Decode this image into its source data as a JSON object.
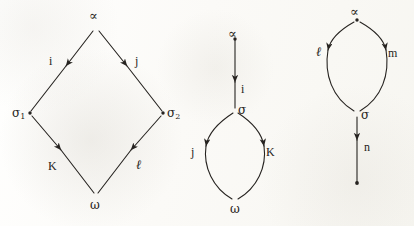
{
  "figure": {
    "background_color": "#fdfdfb",
    "ink_color": "#262320",
    "stroke_width": 1.1,
    "caption_smudge": "",
    "diagrams": [
      {
        "id": "diamond-diagram",
        "name": "diamond",
        "shape": "diamond",
        "nodes": [
          {
            "id": "alpha",
            "label": "∝",
            "role": "top",
            "x": 96,
            "y": 28,
            "label_x": 89,
            "label_y": 9,
            "dot": false
          },
          {
            "id": "sigma1",
            "label": "σ",
            "subscript": "1",
            "role": "left",
            "x": 30,
            "y": 113,
            "label_x": 12,
            "label_y": 107,
            "dot": true
          },
          {
            "id": "sigma2",
            "label": "σ",
            "subscript": "2",
            "role": "right",
            "x": 163,
            "y": 113,
            "label_x": 167,
            "label_y": 107,
            "dot": true
          },
          {
            "id": "omega",
            "label": "ω",
            "role": "bottom",
            "x": 96,
            "y": 197,
            "label_x": 90,
            "label_y": 199,
            "dot": false
          }
        ],
        "edges": [
          {
            "id": "alpha-sigma1",
            "label": "i",
            "from": "alpha",
            "to": "sigma1",
            "label_x": 49,
            "label_y": 55
          },
          {
            "id": "alpha-sigma2",
            "label": "j",
            "from": "alpha",
            "to": "sigma2",
            "label_x": 135,
            "label_y": 55
          },
          {
            "id": "sigma1-omega",
            "label": "K",
            "from": "sigma1",
            "to": "omega",
            "label_x": 48,
            "label_y": 160
          },
          {
            "id": "sigma2-omega",
            "label": "ℓ",
            "from": "sigma2",
            "to": "omega",
            "label_x": 136,
            "label_y": 158
          }
        ]
      },
      {
        "id": "lens-below-diagram",
        "name": "arrow-then-lens",
        "shape": "arrow-over-lens",
        "nodes": [
          {
            "id": "alpha",
            "label": "∝",
            "role": "top",
            "x": 235,
            "y": 38,
            "label_x": 228,
            "label_y": 27,
            "dot": true
          },
          {
            "id": "sigma",
            "label": "σ",
            "role": "middle",
            "x": 235,
            "y": 110,
            "label_x": 238,
            "label_y": 104,
            "dot": false
          },
          {
            "id": "omega",
            "label": "ω",
            "role": "bottom",
            "x": 235,
            "y": 202,
            "label_x": 230,
            "label_y": 203,
            "dot": false
          }
        ],
        "edges": [
          {
            "id": "alpha-sigma",
            "label": "i",
            "from": "alpha",
            "to": "sigma",
            "label_x": 241,
            "label_y": 83
          },
          {
            "id": "sigma-omega-left",
            "label": "j",
            "from": "sigma",
            "to": "omega",
            "side": "left",
            "label_x": 191,
            "label_y": 146
          },
          {
            "id": "sigma-omega-right",
            "label": "K",
            "from": "sigma",
            "to": "omega",
            "side": "right",
            "label_x": 266,
            "label_y": 146
          }
        ]
      },
      {
        "id": "lens-above-diagram",
        "name": "lens-then-arrow",
        "shape": "lens-over-arrow",
        "nodes": [
          {
            "id": "alpha",
            "label": "∝",
            "role": "top",
            "x": 357,
            "y": 20,
            "label_x": 350,
            "label_y": 5,
            "dot": true
          },
          {
            "id": "sigma",
            "label": "σ",
            "role": "middle",
            "x": 357,
            "y": 113,
            "label_x": 361,
            "label_y": 109,
            "dot": false
          },
          {
            "id": "end",
            "label": "",
            "role": "bottom",
            "x": 357,
            "y": 183,
            "label_x": 0,
            "label_y": 0,
            "dot": true
          }
        ],
        "edges": [
          {
            "id": "alpha-sigma-left",
            "label": "ℓ",
            "from": "alpha",
            "to": "sigma",
            "side": "left",
            "label_x": 316,
            "label_y": 45
          },
          {
            "id": "alpha-sigma-right",
            "label": "m",
            "from": "alpha",
            "to": "sigma",
            "side": "right",
            "label_x": 388,
            "label_y": 47
          },
          {
            "id": "sigma-end",
            "label": "n",
            "from": "sigma",
            "to": "end",
            "label_x": 364,
            "label_y": 141
          }
        ]
      }
    ]
  }
}
